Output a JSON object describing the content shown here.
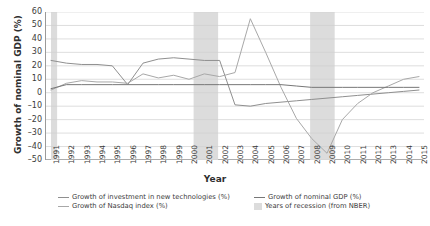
{
  "chart_data": {
    "type": "line",
    "title": "",
    "xlabel": "Year",
    "ylabel": "Growth of nominal GDP (%)",
    "xlim": [
      1991,
      2015
    ],
    "ylim": [
      -50,
      60
    ],
    "yticks": [
      60,
      50,
      40,
      30,
      20,
      10,
      0,
      -10,
      -20,
      -30,
      -40,
      -50
    ],
    "ytick_labels": [
      "60",
      "50",
      "40",
      "30",
      "20",
      "10",
      "0",
      "-10",
      "-20",
      "-30",
      "-40",
      "-50"
    ],
    "grid": true,
    "legend_position": "bottom",
    "categories": [
      1991,
      1992,
      1993,
      1994,
      1995,
      1996,
      1997,
      1998,
      1999,
      2000,
      2001,
      2002,
      2003,
      2004,
      2005,
      2006,
      2007,
      2008,
      2009,
      2010,
      2011,
      2012,
      2013,
      2014,
      2015
    ],
    "xtick_labels": [
      "1991",
      "1992",
      "1993",
      "1994",
      "1995",
      "1996",
      "1997",
      "1998",
      "1999",
      "2000",
      "2001",
      "2002",
      "2003",
      "2004",
      "2005",
      "2006",
      "2007",
      "2008",
      "2009",
      "2010",
      "2011",
      "2012",
      "2013",
      "2014",
      "2015"
    ],
    "series": [
      {
        "name": "Growth of investment in new technologies (%)",
        "color": "#8f8f8f",
        "values": [
          24,
          22,
          21,
          21,
          20,
          6,
          22,
          25,
          26,
          25,
          24,
          24,
          -9,
          -10,
          -8,
          -7,
          -6,
          -5,
          -4,
          -3,
          -2,
          -1,
          0,
          1,
          2
        ]
      },
      {
        "name": "Growth of Nasdaq index (%)",
        "color": "#a8a8a8",
        "values": [
          2,
          7,
          9,
          8,
          8,
          7,
          14,
          11,
          13,
          10,
          14,
          12,
          15,
          55,
          30,
          4,
          -19,
          -34,
          -45,
          -20,
          -8,
          0,
          5,
          10,
          12
        ]
      },
      {
        "name": "Growth of nominal GDP (%)",
        "color": "#777777",
        "values": [
          3,
          6,
          6,
          6,
          6,
          6,
          6,
          6,
          6,
          6,
          6,
          6,
          6,
          6,
          6,
          6,
          5,
          4,
          4,
          4,
          4,
          4,
          4,
          4,
          4
        ]
      }
    ],
    "recession_band_label": "Years of recession (from NBER)",
    "recession_band_color": "#dcdcdc",
    "recession_bands": [
      [
        1991.0,
        1991.4
      ],
      [
        2000.3,
        2001.9
      ],
      [
        2007.9,
        2009.5
      ]
    ]
  },
  "legend": {
    "items": [
      {
        "label": "Growth of investment in new technologies (%)",
        "marker": "line",
        "color": "#8f8f8f"
      },
      {
        "label": "Growth of Nasdaq index (%)",
        "marker": "line",
        "color": "#a8a8a8"
      },
      {
        "label": "Growth of nominal GDP (%)",
        "marker": "line",
        "color": "#777777"
      },
      {
        "label": "Years of recession (from NBER)",
        "marker": "box",
        "color": "#dcdcdc"
      }
    ]
  }
}
